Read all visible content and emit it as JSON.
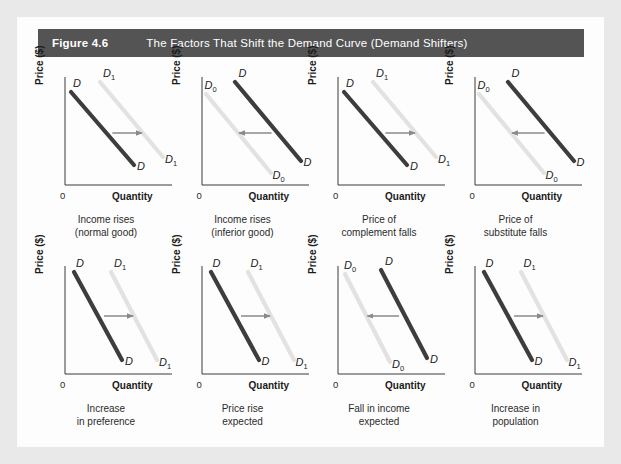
{
  "figure": {
    "number": "Figure 4.6",
    "title": "The Factors That Shift the Demand Curve (Demand Shifters)",
    "header_bg": "#545454",
    "header_text_color": "#ffffff",
    "page_bg": "#e9e9e9",
    "panel_bg": "#fdfdfd"
  },
  "axes": {
    "y_label": "Price ($)",
    "x_label": "Quantity",
    "origin_label": "0",
    "axis_color": "#3a3a3a"
  },
  "style": {
    "dark_curve_color": "#3d3d3d",
    "light_curve_color": "#e2e2e2",
    "arrow_color": "#8a8a8a"
  },
  "panels": [
    {
      "id": "income-rises-normal-good",
      "caption_line1": "Income rises",
      "caption_line2": "(normal good)",
      "direction": "right",
      "slope": "shallow",
      "labels": {
        "dark_top": "D",
        "dark_bottom": "D",
        "light_top": "D1",
        "light_bottom": "D1",
        "light_sub": "1"
      }
    },
    {
      "id": "income-rises-inferior-good",
      "caption_line1": "Income rises",
      "caption_line2": "(inferior good)",
      "direction": "left",
      "slope": "shallow",
      "labels": {
        "dark_top": "D",
        "dark_bottom": "D",
        "light_top": "D0",
        "light_bottom": "D0",
        "light_sub": "0"
      }
    },
    {
      "id": "price-of-complement-falls",
      "caption_line1": "Price of",
      "caption_line2": "complement falls",
      "direction": "right",
      "slope": "shallow",
      "labels": {
        "dark_top": "D",
        "dark_bottom": "D",
        "light_top": "D1",
        "light_bottom": "D1",
        "light_sub": "1"
      }
    },
    {
      "id": "price-of-substitute-falls",
      "caption_line1": "Price of",
      "caption_line2": "substitute falls",
      "direction": "left",
      "slope": "shallow",
      "labels": {
        "dark_top": "D",
        "dark_bottom": "D",
        "light_top": "D0",
        "light_bottom": "D0",
        "light_sub": "0"
      }
    },
    {
      "id": "increase-in-preference",
      "caption_line1": "Increase",
      "caption_line2": "in preference",
      "direction": "right",
      "slope": "steep",
      "labels": {
        "dark_top": "D",
        "dark_bottom": "D",
        "light_top": "D1",
        "light_bottom": "D1",
        "light_sub": "1"
      }
    },
    {
      "id": "price-rise-expected",
      "caption_line1": "Price rise",
      "caption_line2": "expected",
      "direction": "right",
      "slope": "steep",
      "labels": {
        "dark_top": "D",
        "dark_bottom": "D",
        "light_top": "D1",
        "light_bottom": "D1",
        "light_sub": "1"
      }
    },
    {
      "id": "fall-in-income-expected",
      "caption_line1": "Fall in income",
      "caption_line2": "expected",
      "direction": "left",
      "slope": "steep",
      "labels": {
        "dark_top": "D",
        "dark_bottom": "D",
        "light_top": "D0",
        "light_bottom": "D0",
        "light_sub": "0"
      }
    },
    {
      "id": "increase-in-population",
      "caption_line1": "Increase in",
      "caption_line2": "population",
      "direction": "right",
      "slope": "steep",
      "labels": {
        "dark_top": "D",
        "dark_bottom": "D",
        "light_top": "D1",
        "light_bottom": "D1",
        "light_sub": "1"
      }
    }
  ],
  "chart_data": {
    "type": "line",
    "title": "The Factors That Shift the Demand Curve (Demand Shifters)",
    "xlabel": "Quantity",
    "ylabel": "Price ($)",
    "grid": false,
    "legend": "none",
    "note": "Eight schematic demand-curve panels; each shows an original demand curve (dark) and a shifted demand curve (light) connected by a horizontal arrow indicating shift direction.",
    "panels": [
      {
        "name": "Income rises (normal good)",
        "shift": "right",
        "original": "D",
        "shifted": "D1",
        "slope": "shallow"
      },
      {
        "name": "Income rises (inferior good)",
        "shift": "left",
        "original": "D",
        "shifted": "D0",
        "slope": "shallow"
      },
      {
        "name": "Price of complement falls",
        "shift": "right",
        "original": "D",
        "shifted": "D1",
        "slope": "shallow"
      },
      {
        "name": "Price of substitute falls",
        "shift": "left",
        "original": "D",
        "shifted": "D0",
        "slope": "shallow"
      },
      {
        "name": "Increase in preference",
        "shift": "right",
        "original": "D",
        "shifted": "D1",
        "slope": "steep"
      },
      {
        "name": "Price rise expected",
        "shift": "right",
        "original": "D",
        "shifted": "D1",
        "slope": "steep"
      },
      {
        "name": "Fall in income expected",
        "shift": "left",
        "original": "D",
        "shifted": "D0",
        "slope": "steep"
      },
      {
        "name": "Increase in population",
        "shift": "right",
        "original": "D",
        "shifted": "D1",
        "slope": "steep"
      }
    ]
  }
}
